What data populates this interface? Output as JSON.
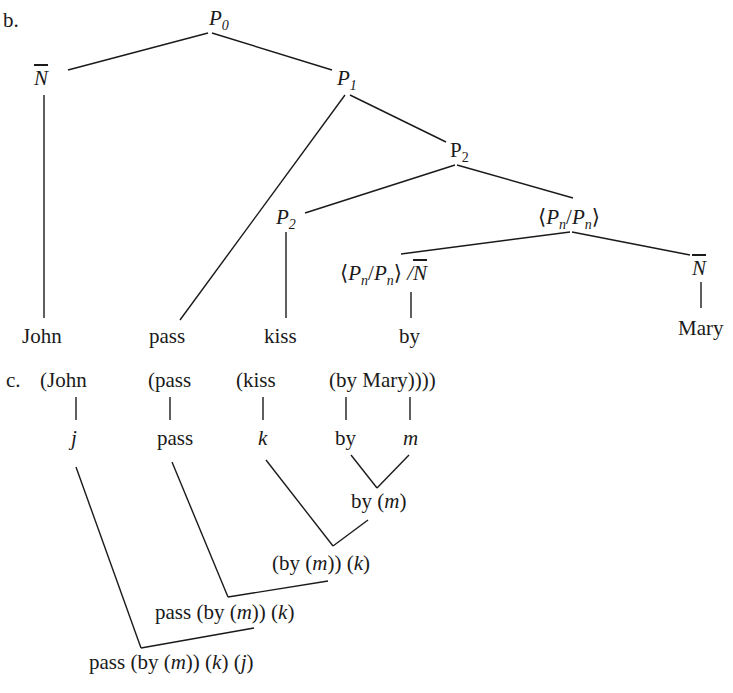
{
  "part_b": {
    "label": "b.",
    "nodes": {
      "P0": {
        "base": "P",
        "sub": "0"
      },
      "Nbar_left": {
        "base": "N"
      },
      "P1": {
        "base": "P",
        "sub": "1"
      },
      "P2_upper": {
        "base": "P",
        "sub": "2"
      },
      "P2_lower": {
        "base": "P",
        "sub": "2"
      },
      "PnPn": {
        "open": "⟨",
        "a": "P",
        "a_sub": "n",
        "slash": "/",
        "b": "P",
        "b_sub": "n",
        "close": "⟩"
      },
      "PnPn_N": {
        "open": "⟨",
        "a": "P",
        "a_sub": "n",
        "slash": "/",
        "b": "P",
        "b_sub": "n",
        "close": "⟩",
        "slash2": " /",
        "n": "N"
      },
      "Nbar_right": {
        "base": "N"
      }
    },
    "leaves": [
      "John",
      "pass",
      "kiss",
      "by",
      "Mary"
    ]
  },
  "part_c": {
    "label": "c.",
    "top_row": [
      "(John",
      "(pass",
      "(kiss",
      "(by Mary))))"
    ],
    "translations": {
      "john": "j",
      "pass": "pass",
      "kiss": "k",
      "by": "by",
      "mary": "m"
    },
    "steps": [
      {
        "pre": "by (",
        "var": "m",
        "post": ")"
      },
      {
        "text": "(by (",
        "v1": "m",
        "mid": ")) (",
        "v2": "k",
        "end": ")"
      },
      {
        "text": "pass (by (",
        "v1": "m",
        "mid": ")) (",
        "v2": "k",
        "end": ")"
      },
      {
        "text": "pass (by (",
        "v1": "m",
        "mid": ")) (",
        "v2": "k",
        "mid2": ") (",
        "v3": "j",
        "end": ")"
      }
    ]
  }
}
